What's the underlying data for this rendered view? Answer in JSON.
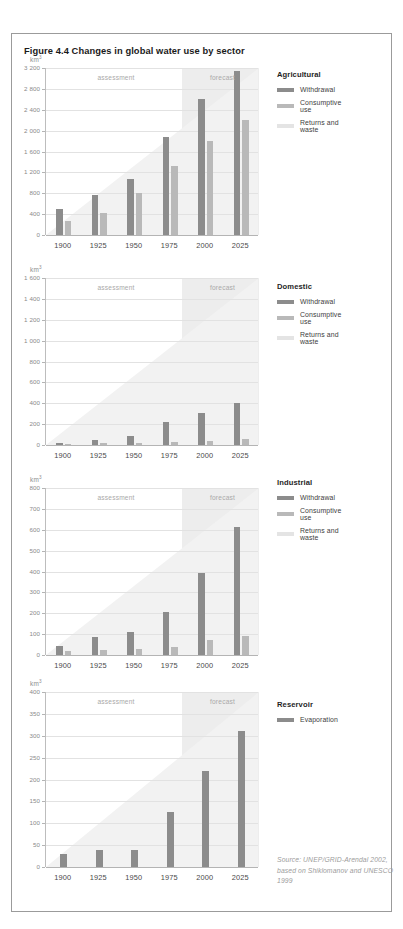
{
  "figure": {
    "title": "Figure 4.4 Changes in global water use by sector",
    "unit": "km",
    "unit_sup": "3",
    "source": "Source: UNEP/GRID-Arendal 2002, based on Shiklomanov and UNESCO 1999",
    "phase_assessment": "assessment",
    "phase_forecast": "forecast",
    "colors": {
      "withdrawal": "#8c8c8c",
      "consumptive": "#b9b9b9",
      "returns": "#e4e4e4",
      "forecast_band": "#ededed",
      "grid": "#e2e2e2",
      "axis": "#b4b4b4",
      "frame": "#9b9b9b",
      "title": "#1a1a1a",
      "source_text": "#9c9c9c"
    }
  },
  "chart_data": [
    {
      "type": "bar",
      "title": "Agricultural",
      "xlabel": "",
      "ylabel": "km3",
      "categories": [
        "1900",
        "1925",
        "1950",
        "1975",
        "2000",
        "2025"
      ],
      "ylim": [
        0,
        3200
      ],
      "yticks": [
        0,
        400,
        800,
        1200,
        1600,
        2000,
        2400,
        2800,
        3200
      ],
      "ytick_labels": [
        "0",
        "400",
        "800",
        "1 200",
        "1 600",
        "2 000",
        "2 400",
        "2 800",
        "3 200"
      ],
      "grid": true,
      "legend_position": "right",
      "forecast_start_index": 4,
      "series": [
        {
          "name": "Withdrawal",
          "color": "#8c8c8c",
          "values": [
            500,
            760,
            1080,
            1880,
            2600,
            3150
          ]
        },
        {
          "name": "Consumptive use",
          "color": "#b9b9b9",
          "values": [
            270,
            430,
            800,
            1320,
            1800,
            2200
          ]
        },
        {
          "name": "Returns and waste",
          "color": "#e4e4e4",
          "values": [
            0,
            0,
            0,
            0,
            0,
            0
          ]
        }
      ]
    },
    {
      "type": "bar",
      "title": "Domestic",
      "xlabel": "",
      "ylabel": "km3",
      "categories": [
        "1900",
        "1925",
        "1950",
        "1975",
        "2000",
        "2025"
      ],
      "ylim": [
        0,
        1600
      ],
      "yticks": [
        0,
        200,
        400,
        600,
        800,
        1000,
        1200,
        1400,
        1600
      ],
      "ytick_labels": [
        "0",
        "200",
        "400",
        "600",
        "800",
        "1 000",
        "1 200",
        "1 400",
        "1 600"
      ],
      "grid": true,
      "legend_position": "right",
      "forecast_start_index": 4,
      "series": [
        {
          "name": "Withdrawal",
          "color": "#8c8c8c",
          "values": [
            20,
            45,
            85,
            220,
            310,
            400
          ]
        },
        {
          "name": "Consumptive use",
          "color": "#b9b9b9",
          "values": [
            10,
            15,
            20,
            25,
            40,
            60
          ]
        },
        {
          "name": "Returns and waste",
          "color": "#e4e4e4",
          "values": [
            0,
            0,
            0,
            0,
            0,
            0
          ]
        }
      ]
    },
    {
      "type": "bar",
      "title": "Industrial",
      "xlabel": "",
      "ylabel": "km3",
      "categories": [
        "1900",
        "1925",
        "1950",
        "1975",
        "2000",
        "2025"
      ],
      "ylim": [
        0,
        800
      ],
      "yticks": [
        0,
        100,
        200,
        300,
        400,
        500,
        600,
        700,
        800
      ],
      "ytick_labels": [
        "0",
        "100",
        "200",
        "300",
        "400",
        "500",
        "600",
        "700",
        "800"
      ],
      "grid": true,
      "legend_position": "right",
      "forecast_start_index": 4,
      "series": [
        {
          "name": "Withdrawal",
          "color": "#8c8c8c",
          "values": [
            45,
            85,
            110,
            205,
            395,
            615
          ]
        },
        {
          "name": "Consumptive use",
          "color": "#b9b9b9",
          "values": [
            18,
            22,
            28,
            38,
            70,
            90
          ]
        },
        {
          "name": "Returns and waste",
          "color": "#e4e4e4",
          "values": [
            0,
            0,
            0,
            0,
            0,
            0
          ]
        }
      ]
    },
    {
      "type": "bar",
      "title": "Reservoir",
      "xlabel": "",
      "ylabel": "km3",
      "categories": [
        "1900",
        "1925",
        "1950",
        "1975",
        "2000",
        "2025"
      ],
      "ylim": [
        0,
        400
      ],
      "yticks": [
        0,
        50,
        100,
        150,
        200,
        250,
        300,
        350,
        400
      ],
      "ytick_labels": [
        "0",
        "50",
        "100",
        "150",
        "200",
        "250",
        "300",
        "350",
        "400"
      ],
      "grid": true,
      "legend_position": "right",
      "forecast_start_index": 4,
      "series": [
        {
          "name": "Evaporation",
          "color": "#8c8c8c",
          "values": [
            30,
            40,
            40,
            125,
            220,
            310
          ]
        }
      ]
    }
  ]
}
